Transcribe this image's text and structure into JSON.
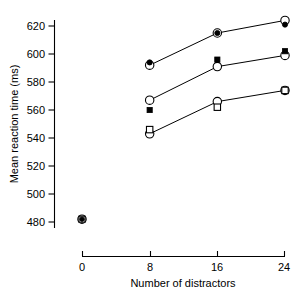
{
  "chart_data": {
    "type": "line",
    "title": "",
    "xlabel": "Number of distractors",
    "ylabel": "Mean reaction time (ms)",
    "x": [
      0,
      8,
      16,
      24
    ],
    "xlim": [
      0,
      24
    ],
    "ylim": [
      478,
      628
    ],
    "xticks": [
      0,
      8,
      16,
      24
    ],
    "xtick_labels": [
      "0",
      "8",
      "16",
      "24"
    ],
    "yticks": [
      480,
      500,
      520,
      540,
      560,
      580,
      600,
      620
    ],
    "ytick_labels": [
      "480",
      "500",
      "520",
      "540",
      "560",
      "580",
      "600",
      "620"
    ],
    "grid": false,
    "legend": "none",
    "series": [
      {
        "name": "upper-open-circle",
        "marker": "open-circle",
        "connected": true,
        "x": [
          8,
          16,
          24
        ],
        "values": [
          592,
          615,
          624
        ]
      },
      {
        "name": "upper-filled-circle",
        "marker": "filled-circle",
        "connected": false,
        "x": [
          8,
          16,
          24
        ],
        "values": [
          594,
          615,
          621
        ]
      },
      {
        "name": "middle-open-circle",
        "marker": "open-circle",
        "connected": true,
        "x": [
          8,
          16,
          24
        ],
        "values": [
          567,
          591,
          599
        ]
      },
      {
        "name": "middle-filled-square",
        "marker": "filled-square",
        "connected": false,
        "x": [
          8,
          16,
          24
        ],
        "values": [
          560,
          596,
          602
        ]
      },
      {
        "name": "lower-open-circle",
        "marker": "open-circle",
        "connected": true,
        "x": [
          8,
          16,
          24
        ],
        "values": [
          543,
          566,
          574
        ]
      },
      {
        "name": "lower-open-square",
        "marker": "open-square",
        "connected": false,
        "x": [
          8,
          16,
          24
        ],
        "values": [
          546,
          562,
          574
        ]
      },
      {
        "name": "baseline-cluster",
        "marker": "overlapping-cluster",
        "connected": false,
        "x": [
          0
        ],
        "values": [
          482
        ]
      }
    ]
  }
}
